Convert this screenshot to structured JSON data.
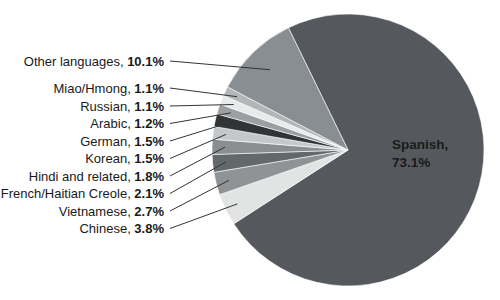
{
  "figure": {
    "background": "#ffffff",
    "title": ""
  },
  "chart_data": {
    "type": "pie",
    "unit": "%",
    "direction": "clockwise",
    "start_angle_deg": 334,
    "legend_position": "none",
    "callout_text_color": "#1a1a1a",
    "leader_line_color": "#333333",
    "separator_color": "#ffffff",
    "slices": [
      {
        "label": "Spanish",
        "value": 73.1,
        "color": "#55595d",
        "callout": "inside"
      },
      {
        "label": "Chinese",
        "value": 3.8,
        "color": "#e2e4e4",
        "callout": "left"
      },
      {
        "label": "Vietnamese",
        "value": 2.7,
        "color": "#8f9396",
        "callout": "left"
      },
      {
        "label": "French/Haitian Creole",
        "value": 2.1,
        "color": "#63686b",
        "callout": "left"
      },
      {
        "label": "Hindi and related",
        "value": 1.8,
        "color": "#8a8e91",
        "callout": "left"
      },
      {
        "label": "Korean",
        "value": 1.5,
        "color": "#c5c8ca",
        "callout": "left"
      },
      {
        "label": "German",
        "value": 1.5,
        "color": "#303437",
        "callout": "left"
      },
      {
        "label": "Arabic",
        "value": 1.2,
        "color": "#9b9fa2",
        "callout": "left"
      },
      {
        "label": "Russian",
        "value": 1.1,
        "color": "#e9ebeb",
        "callout": "left"
      },
      {
        "label": "Miao/Hmong",
        "value": 1.1,
        "color": "#b2b6b8",
        "callout": "left"
      },
      {
        "label": "Other languages",
        "value": 10.1,
        "color": "#898e92",
        "callout": "left"
      }
    ],
    "inside_label": {
      "line1": "Spanish,",
      "line2": "73.1%",
      "color": "#ffffff"
    }
  }
}
